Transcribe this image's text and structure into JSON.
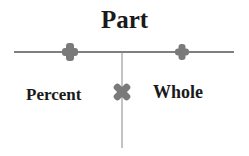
{
  "diagram": {
    "title": "Part",
    "left_label": "Percent",
    "right_label": "Whole",
    "symbols": [
      "plus-icon",
      "plus-icon",
      "times-icon"
    ],
    "colors": {
      "line": "#555555",
      "symbol": "#7a7a7a",
      "text": "#1a1a1a"
    }
  }
}
